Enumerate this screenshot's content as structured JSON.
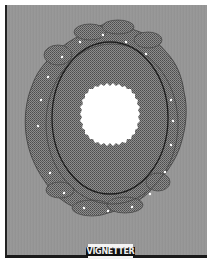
{
  "image": {
    "subject": "photographic-vignetter-mask",
    "label": "VIGNETTER",
    "colors": {
      "background": "#ffffff",
      "board": "#979797",
      "mask_pattern": "#6e6e6e",
      "opening": "#ffffff",
      "border": "#1a1a1a"
    }
  }
}
